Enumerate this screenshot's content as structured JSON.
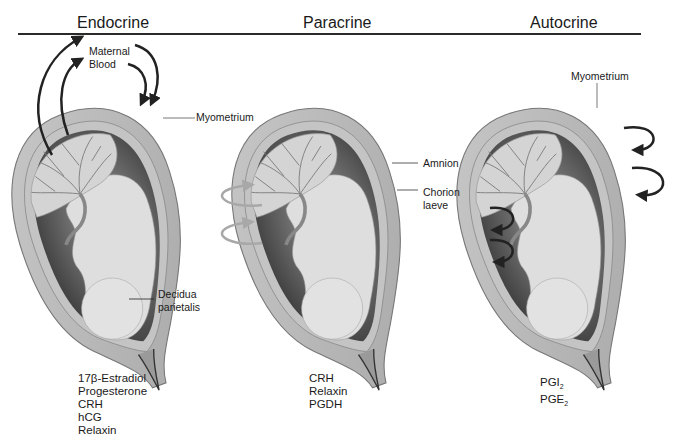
{
  "figure": {
    "panels": [
      {
        "title": "Endocrine",
        "labels": {
          "maternal_blood": [
            "Maternal",
            "Blood"
          ],
          "myometrium": "Myometrium",
          "decidua": [
            "Decidua",
            "parietalis"
          ]
        },
        "hormones": [
          "17β-Estradiol",
          "Progesterone",
          "CRH",
          "hCG",
          "Relaxin"
        ]
      },
      {
        "title": "Paracrine",
        "labels": {
          "amnion": "Amnion",
          "chorion": [
            "Chorion",
            "laeve"
          ]
        },
        "hormones": [
          "CRH",
          "Relaxin",
          "PGDH"
        ]
      },
      {
        "title": "Autocrine",
        "labels": {
          "myometrium": "Myometrium"
        },
        "hormones": [
          {
            "base": "PGI",
            "sub": "2"
          },
          {
            "base": "PGE",
            "sub": "2"
          }
        ]
      }
    ],
    "colors": {
      "wall": "#b9b9b9",
      "wall_edge": "#8a8a8a",
      "cavity_dark": "#3a3a3a",
      "fetus": "#dcdcdc",
      "placenta": "#cfcfcf",
      "arrow_dark": "#222222",
      "arrow_light": "#a8a8a8"
    }
  }
}
